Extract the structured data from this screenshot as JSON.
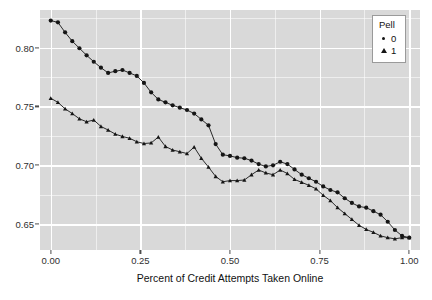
{
  "chart_data": {
    "type": "line",
    "title": "",
    "xlabel": "Percent of Credit Attempts Taken Online",
    "ylabel": "",
    "xlim": [
      -0.03,
      1.03
    ],
    "ylim": [
      0.628,
      0.832
    ],
    "xticks": [
      "0.00",
      "0.25",
      "0.50",
      "0.75",
      "1.00"
    ],
    "xtick_values": [
      0.0,
      0.25,
      0.5,
      0.75,
      1.0
    ],
    "yticks": [
      "0.65",
      "0.70",
      "0.75",
      "0.80"
    ],
    "ytick_values": [
      0.65,
      0.7,
      0.75,
      0.8
    ],
    "grid": true,
    "legend": {
      "title": "Pell",
      "position": "top-right",
      "entries": [
        {
          "label": "0",
          "marker": "circle"
        },
        {
          "label": "1",
          "marker": "triangle"
        }
      ]
    },
    "series": [
      {
        "name": "0",
        "marker": "circle",
        "color": "#151515",
        "x": [
          0.0,
          0.02,
          0.04,
          0.06,
          0.08,
          0.1,
          0.12,
          0.14,
          0.16,
          0.18,
          0.2,
          0.22,
          0.24,
          0.26,
          0.28,
          0.3,
          0.32,
          0.34,
          0.36,
          0.38,
          0.4,
          0.42,
          0.44,
          0.46,
          0.48,
          0.5,
          0.52,
          0.54,
          0.56,
          0.58,
          0.6,
          0.62,
          0.64,
          0.66,
          0.68,
          0.7,
          0.72,
          0.74,
          0.76,
          0.78,
          0.8,
          0.82,
          0.84,
          0.86,
          0.88,
          0.9,
          0.92,
          0.94,
          0.96,
          0.98,
          1.0
        ],
        "y": [
          0.823,
          0.8215,
          0.813,
          0.8055,
          0.7995,
          0.7935,
          0.788,
          0.783,
          0.7785,
          0.78,
          0.781,
          0.7785,
          0.776,
          0.77,
          0.762,
          0.756,
          0.7535,
          0.751,
          0.749,
          0.747,
          0.744,
          0.739,
          0.734,
          0.718,
          0.709,
          0.708,
          0.7065,
          0.706,
          0.704,
          0.701,
          0.699,
          0.7,
          0.703,
          0.701,
          0.6965,
          0.692,
          0.689,
          0.686,
          0.682,
          0.679,
          0.677,
          0.672,
          0.668,
          0.665,
          0.664,
          0.661,
          0.658,
          0.652,
          0.645,
          0.64,
          0.6385
        ]
      },
      {
        "name": "1",
        "marker": "triangle",
        "color": "#151515",
        "x": [
          0.0,
          0.02,
          0.04,
          0.06,
          0.08,
          0.1,
          0.12,
          0.14,
          0.16,
          0.18,
          0.2,
          0.22,
          0.24,
          0.26,
          0.28,
          0.3,
          0.32,
          0.34,
          0.36,
          0.38,
          0.4,
          0.42,
          0.44,
          0.46,
          0.48,
          0.5,
          0.52,
          0.54,
          0.56,
          0.58,
          0.6,
          0.62,
          0.64,
          0.66,
          0.68,
          0.7,
          0.72,
          0.74,
          0.76,
          0.78,
          0.8,
          0.82,
          0.84,
          0.86,
          0.88,
          0.9,
          0.92,
          0.94,
          0.96,
          0.98,
          1.0
        ],
        "y": [
          0.757,
          0.7535,
          0.748,
          0.744,
          0.7395,
          0.737,
          0.7385,
          0.733,
          0.73,
          0.7265,
          0.7245,
          0.723,
          0.72,
          0.7185,
          0.719,
          0.724,
          0.716,
          0.713,
          0.7115,
          0.71,
          0.7155,
          0.706,
          0.6985,
          0.6905,
          0.686,
          0.687,
          0.687,
          0.6875,
          0.692,
          0.696,
          0.6935,
          0.692,
          0.696,
          0.693,
          0.688,
          0.6855,
          0.683,
          0.68,
          0.6745,
          0.67,
          0.664,
          0.659,
          0.654,
          0.649,
          0.6455,
          0.643,
          0.64,
          0.6385,
          0.6375,
          0.6385,
          0.6385
        ]
      }
    ]
  }
}
